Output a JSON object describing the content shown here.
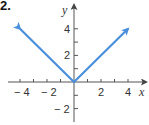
{
  "problem_number": "2.",
  "chart_data": {
    "type": "line",
    "title": "",
    "xlabel": "x",
    "ylabel": "y",
    "xlim": [
      -4.5,
      4.8
    ],
    "ylim": [
      -2.8,
      5
    ],
    "x_ticks": [
      -4,
      -3,
      -2,
      -1,
      1,
      2,
      3,
      4
    ],
    "x_tick_labels": [
      "-4",
      "-2",
      "2",
      "4"
    ],
    "y_ticks": [
      -2,
      -1,
      1,
      2,
      3,
      4
    ],
    "y_tick_labels": [
      "4",
      "2",
      "-2"
    ],
    "grid": false,
    "series": [
      {
        "name": "y = |x|",
        "color": "#4a8fdc",
        "x": [
          -4,
          0,
          4
        ],
        "y": [
          4,
          0,
          4
        ],
        "arrows": "both"
      }
    ]
  }
}
